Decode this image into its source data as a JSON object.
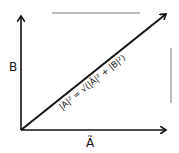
{
  "diagram": {
    "type": "vector-diagram",
    "axes": {
      "vertical_label": "B",
      "horizontal_label": "Ã"
    },
    "resultant": {
      "equation": "|A|² = √(|Ã|² + |B|²)"
    },
    "colors": {
      "ink": "#111111",
      "faint_line": "#555555",
      "background": "#ffffff"
    }
  }
}
